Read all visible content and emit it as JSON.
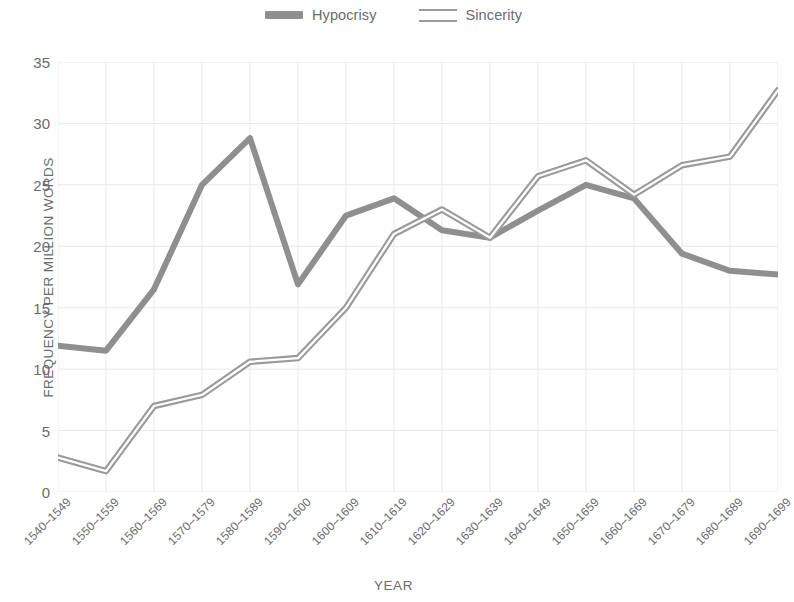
{
  "chart_data": {
    "type": "line",
    "title": "",
    "xlabel": "YEAR",
    "ylabel": "FREQUENCY PER MILLION WORDS",
    "ylim": [
      0,
      35
    ],
    "yticks": [
      0,
      5,
      10,
      15,
      20,
      25,
      30,
      35
    ],
    "grid": true,
    "legend_position": "top-center",
    "categories": [
      "1540–1549",
      "1550–1559",
      "1560–1569",
      "1570–1579",
      "1580–1589",
      "1590–1600",
      "1600–1609",
      "1610–1619",
      "1620–1629",
      "1630–1639",
      "1640–1649",
      "1650–1659",
      "1660–1669",
      "1670–1679",
      "1680–1689",
      "1690–1699"
    ],
    "series": [
      {
        "name": "Hypocrisy",
        "style": "solid",
        "color": "#8f8f8f",
        "values": [
          11.9,
          11.5,
          16.5,
          25.0,
          28.8,
          16.9,
          22.5,
          23.9,
          21.3,
          20.7,
          22.9,
          25.0,
          23.9,
          19.4,
          18.0,
          17.7
        ]
      },
      {
        "name": "Sincerity",
        "style": "hollow",
        "color": "#9a9a9a",
        "values": [
          2.8,
          1.7,
          7.0,
          7.9,
          10.6,
          10.9,
          15.0,
          21.0,
          23.0,
          20.7,
          25.7,
          27.0,
          24.2,
          26.6,
          27.3,
          32.7
        ]
      }
    ]
  },
  "legend": {
    "entries": [
      {
        "label": "Hypocrisy",
        "swatch": "solid-line-swatch"
      },
      {
        "label": "Sincerity",
        "swatch": "hollow-line-swatch"
      }
    ]
  },
  "axes": {
    "y_title": "FREQUENCY PER MILLION WORDS",
    "x_title": "YEAR"
  },
  "colors": {
    "line_gray": "#8f8f8f",
    "grid": "#e9e9e9",
    "text": "#6b6b6b",
    "background": "#ffffff"
  }
}
